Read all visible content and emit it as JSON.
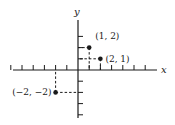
{
  "diagram": {
    "type": "coordinate-plane",
    "axes": {
      "x_label": "x",
      "y_label": "y"
    },
    "unit_px": 11.2,
    "origin_px": [
      78,
      70
    ],
    "x_ticks": [
      -6,
      -5,
      -4,
      -3,
      -2,
      -1,
      1,
      2,
      3,
      4,
      5,
      6
    ],
    "y_ticks": [
      -4,
      -3,
      -2,
      -1,
      1,
      2,
      3
    ],
    "points": [
      {
        "label": "(1, 2)",
        "x": 1,
        "y": 2
      },
      {
        "label": "(2, 1)",
        "x": 2,
        "y": 1
      },
      {
        "label": "(−2, −2)",
        "x": -2,
        "y": -2
      }
    ],
    "colors": {
      "ink": "#1a1a1a",
      "background": "#ffffff"
    }
  }
}
